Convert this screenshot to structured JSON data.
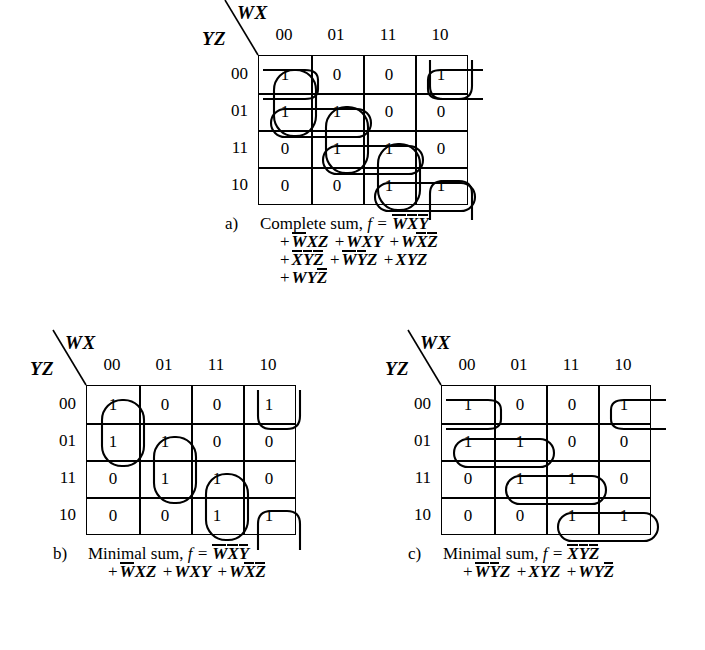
{
  "figure": {
    "type": "karnaugh-maps",
    "variables": [
      "W",
      "X",
      "Y",
      "Z"
    ],
    "column_axis_label": "WX",
    "row_axis_label": "YZ",
    "column_headers": [
      "00",
      "01",
      "11",
      "10"
    ],
    "row_headers": [
      "00",
      "01",
      "11",
      "10"
    ]
  },
  "maps": [
    {
      "id": "a",
      "letter": "a)",
      "axis_wx": "WX",
      "axis_yz": "YZ",
      "col_headers": [
        "00",
        "01",
        "11",
        "10"
      ],
      "row_headers": [
        "00",
        "01",
        "11",
        "10"
      ],
      "cells": [
        [
          "1",
          "0",
          "0",
          "1"
        ],
        [
          "1",
          "1",
          "0",
          "0"
        ],
        [
          "0",
          "1",
          "1",
          "0"
        ],
        [
          "0",
          "0",
          "1",
          "1"
        ]
      ],
      "caption_prefix": "Complete sum, ",
      "caption_fn": "f =",
      "groups": [
        {
          "name": "WbarXbarYbar",
          "cells": [
            [
              0,
              0
            ],
            [
              1,
              0
            ]
          ]
        },
        {
          "name": "WbarXZ",
          "cells": [
            [
              1,
              1
            ],
            [
              2,
              1
            ]
          ]
        },
        {
          "name": "WXY",
          "cells": [
            [
              2,
              2
            ],
            [
              3,
              2
            ]
          ]
        },
        {
          "name": "WXbarZbar",
          "cells": [
            [
              0,
              3
            ],
            [
              3,
              3
            ]
          ],
          "wrap": "vertical"
        },
        {
          "name": "XbarYbarZbar",
          "cells": [
            [
              0,
              0
            ],
            [
              0,
              3
            ]
          ],
          "wrap": "horizontal"
        },
        {
          "name": "WbarYbarZ",
          "cells": [
            [
              1,
              0
            ],
            [
              1,
              1
            ]
          ]
        },
        {
          "name": "XYZ",
          "cells": [
            [
              2,
              1
            ],
            [
              2,
              2
            ]
          ]
        },
        {
          "name": "WYZbar",
          "cells": [
            [
              3,
              2
            ],
            [
              3,
              3
            ]
          ]
        }
      ],
      "terms": [
        [
          "W",
          "X",
          "Y"
        ],
        [
          "W",
          "X",
          "Z"
        ],
        [
          "W",
          "X",
          "Y"
        ],
        [
          "W",
          "X",
          "Z"
        ],
        [
          "X",
          "Y",
          "Z"
        ],
        [
          "W",
          "Y",
          "Z"
        ],
        [
          "X",
          "Y",
          "Z"
        ],
        [
          "W",
          "Y",
          "Z"
        ]
      ],
      "expression_lines": [
        [
          {
            "text": "W",
            "bar": true
          },
          {
            "text": "X",
            "bar": true
          },
          {
            "text": "Y",
            "bar": true
          }
        ],
        [
          {
            "op": "+"
          },
          {
            "text": "W",
            "bar": true
          },
          {
            "text": "X",
            "bar": false
          },
          {
            "text": "Z",
            "bar": false
          },
          {
            "op": "+"
          },
          {
            "text": "W",
            "bar": false
          },
          {
            "text": "X",
            "bar": false
          },
          {
            "text": "Y",
            "bar": false
          },
          {
            "op": "+"
          },
          {
            "text": "W",
            "bar": false
          },
          {
            "text": "X",
            "bar": true
          },
          {
            "text": "Z",
            "bar": true
          }
        ],
        [
          {
            "op": "+"
          },
          {
            "text": "X",
            "bar": true
          },
          {
            "text": "Y",
            "bar": true
          },
          {
            "text": "Z",
            "bar": true
          },
          {
            "op": "+"
          },
          {
            "text": "W",
            "bar": true
          },
          {
            "text": "Y",
            "bar": true
          },
          {
            "text": "Z",
            "bar": false
          },
          {
            "op": "+"
          },
          {
            "text": "X",
            "bar": false
          },
          {
            "text": "Y",
            "bar": false
          },
          {
            "text": "Z",
            "bar": false
          }
        ],
        [
          {
            "op": "+"
          },
          {
            "text": "W",
            "bar": false
          },
          {
            "text": "Y",
            "bar": false
          },
          {
            "text": "Z",
            "bar": true
          }
        ]
      ]
    },
    {
      "id": "b",
      "letter": "b)",
      "axis_wx": "WX",
      "axis_yz": "YZ",
      "col_headers": [
        "00",
        "01",
        "11",
        "10"
      ],
      "row_headers": [
        "00",
        "01",
        "11",
        "10"
      ],
      "cells": [
        [
          "1",
          "0",
          "0",
          "1"
        ],
        [
          "1",
          "1",
          "0",
          "0"
        ],
        [
          "0",
          "1",
          "1",
          "0"
        ],
        [
          "0",
          "0",
          "1",
          "1"
        ]
      ],
      "caption_prefix": "Minimal sum, ",
      "caption_fn": "f =",
      "groups": [
        {
          "name": "WbarXbarYbar",
          "cells": [
            [
              0,
              0
            ],
            [
              1,
              0
            ]
          ]
        },
        {
          "name": "WbarXZ",
          "cells": [
            [
              1,
              1
            ],
            [
              2,
              1
            ]
          ]
        },
        {
          "name": "WXY",
          "cells": [
            [
              2,
              2
            ],
            [
              3,
              2
            ]
          ]
        },
        {
          "name": "WXbarZbar",
          "cells": [
            [
              0,
              3
            ],
            [
              3,
              3
            ]
          ],
          "wrap": "vertical"
        }
      ],
      "expression_lines": [
        [
          {
            "text": "W",
            "bar": true
          },
          {
            "text": "X",
            "bar": true
          },
          {
            "text": "Y",
            "bar": true
          }
        ],
        [
          {
            "op": "+"
          },
          {
            "text": "W",
            "bar": true
          },
          {
            "text": "X",
            "bar": false
          },
          {
            "text": "Z",
            "bar": false
          },
          {
            "op": "+"
          },
          {
            "text": "W",
            "bar": false
          },
          {
            "text": "X",
            "bar": false
          },
          {
            "text": "Y",
            "bar": false
          },
          {
            "op": "+"
          },
          {
            "text": "W",
            "bar": false
          },
          {
            "text": "X",
            "bar": true
          },
          {
            "text": "Z",
            "bar": true
          }
        ]
      ]
    },
    {
      "id": "c",
      "letter": "c)",
      "axis_wx": "WX",
      "axis_yz": "YZ",
      "col_headers": [
        "00",
        "01",
        "11",
        "10"
      ],
      "row_headers": [
        "00",
        "01",
        "11",
        "10"
      ],
      "cells": [
        [
          "1",
          "0",
          "0",
          "1"
        ],
        [
          "1",
          "1",
          "0",
          "0"
        ],
        [
          "0",
          "1",
          "1",
          "0"
        ],
        [
          "0",
          "0",
          "1",
          "1"
        ]
      ],
      "caption_prefix": "Minimal sum, ",
      "caption_fn": "f =",
      "groups": [
        {
          "name": "XbarYbarZbar",
          "cells": [
            [
              0,
              0
            ],
            [
              0,
              3
            ]
          ],
          "wrap": "horizontal"
        },
        {
          "name": "WbarYbarZ",
          "cells": [
            [
              1,
              0
            ],
            [
              1,
              1
            ]
          ]
        },
        {
          "name": "XYZ",
          "cells": [
            [
              2,
              1
            ],
            [
              2,
              2
            ]
          ]
        },
        {
          "name": "WYZbar",
          "cells": [
            [
              3,
              2
            ],
            [
              3,
              3
            ]
          ]
        }
      ],
      "expression_lines": [
        [
          {
            "text": "X",
            "bar": true
          },
          {
            "text": "Y",
            "bar": true
          },
          {
            "text": "Z",
            "bar": true
          }
        ],
        [
          {
            "op": "+"
          },
          {
            "text": "W",
            "bar": true
          },
          {
            "text": "Y",
            "bar": true
          },
          {
            "text": "Z",
            "bar": false
          },
          {
            "op": "+"
          },
          {
            "text": "X",
            "bar": false
          },
          {
            "text": "Y",
            "bar": false
          },
          {
            "text": "Z",
            "bar": false
          },
          {
            "op": "+"
          },
          {
            "text": "W",
            "bar": false
          },
          {
            "text": "Y",
            "bar": false
          },
          {
            "text": "Z",
            "bar": true
          }
        ]
      ]
    }
  ],
  "colors": {
    "ink": "#000000",
    "paper": "#ffffff"
  }
}
